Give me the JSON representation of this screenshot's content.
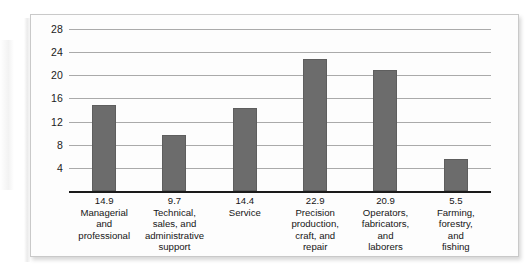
{
  "chart_data": {
    "type": "bar",
    "title": "",
    "subtitle": "",
    "xlabel": "",
    "ylabel": "",
    "ylim": [
      0,
      30
    ],
    "yticks": [
      4,
      8,
      12,
      16,
      20,
      24,
      28
    ],
    "grid": true,
    "legend": null,
    "bar_color": "#6c6c6c",
    "categories": [
      "Managerial\nand\nprofessional",
      "Technical,\nsales, and\nadministrative\nsupport",
      "Service",
      "Precision\nproduction,\ncraft, and\nrepair",
      "Operators,\nfabricators,\nand\nlaborers",
      "Farming,\nforestry,\nand\nfishing"
    ],
    "values": [
      14.9,
      9.7,
      14.4,
      22.9,
      20.9,
      5.5
    ],
    "data_labels": [
      "14.9",
      "9.7",
      "14.4",
      "22.9",
      "20.9",
      "5.5"
    ],
    "tick_labels": [
      "28",
      "24",
      "20",
      "16",
      "12",
      "8",
      "4"
    ]
  }
}
